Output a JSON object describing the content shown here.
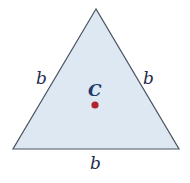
{
  "diagram": {
    "type": "equilateral-triangle",
    "fill_color": "#dde8f2",
    "stroke_color": "#4a5563",
    "vertices": {
      "apex": [
        96,
        9
      ],
      "bottom_left": [
        13,
        149
      ],
      "bottom_right": [
        179,
        149
      ]
    },
    "side_labels": {
      "left": "b",
      "right": "b",
      "bottom": "b"
    },
    "center": {
      "label": "C",
      "point_color": "#b0242a",
      "point": [
        95,
        105
      ]
    }
  }
}
